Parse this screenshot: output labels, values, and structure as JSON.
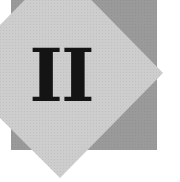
{
  "divider": {
    "numeral": "II",
    "colors": {
      "background": "#ffffff",
      "square": "#9a9a9a",
      "diamond": "#cdcdcd",
      "numeral": "#141414"
    }
  }
}
